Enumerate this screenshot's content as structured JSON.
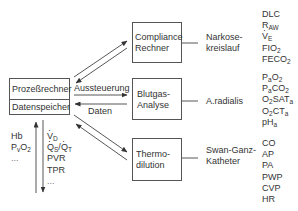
{
  "diagram": {
    "main_box": {
      "top_label": "Prozeßrechner",
      "bottom_label": "Datenspeicher"
    },
    "arrow_labels": {
      "control": "Aussteuerung",
      "data": "Daten"
    },
    "modules": [
      {
        "line1": "Compliance",
        "line2": "Rechner",
        "source1": "Narkose-",
        "source2": "kreislauf",
        "parameters": [
          "DLC",
          "R_AW",
          "V̇_E",
          "FIO_2",
          "FECO_2"
        ]
      },
      {
        "line1": "Blutgas-",
        "line2": "Analyse",
        "source1": "A.radialis",
        "source2": "",
        "parameters": [
          "P_aO_2",
          "P_aCO_2",
          "O_2SAT_a",
          "O_2CT_a",
          "pH_a"
        ]
      },
      {
        "line1": "Thermo-",
        "line2": "dilution",
        "source1": "Swan-Ganz-",
        "source2": "Katheter",
        "parameters": [
          "CO",
          "AP",
          "PA",
          "PWP",
          "CVP",
          "HR"
        ]
      }
    ],
    "input_list": {
      "items": [
        "Hb",
        "P_vO_2",
        "..."
      ]
    },
    "output_list": {
      "items": [
        "V̇_D",
        "Q̇_S/Q̇_T",
        "PVR",
        "TPR",
        "..."
      ]
    }
  }
}
